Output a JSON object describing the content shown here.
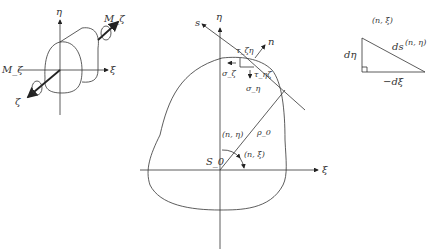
{
  "figure": {
    "left_panel": {
      "axis_eta": "η",
      "axis_xi": "ξ",
      "axis_zeta": "ζ",
      "moment_top": "M_ζ",
      "moment_left": "M_ζ"
    },
    "center_panel": {
      "axis_eta": "η",
      "axis_xi": "ξ",
      "tangent_s": "s",
      "normal_n": "n",
      "tau_zeta_eta": "τ_ζη",
      "sigma_zeta": "σ_ζ",
      "tau_eta_zeta": "τ_ηζ",
      "sigma_eta": "σ_η",
      "rho0": "ρ_0",
      "origin": "S_0",
      "angle_n_eta": "(n, η)",
      "angle_n_xi": "(n, ξ)"
    },
    "right_panel": {
      "angle_n_xi": "(n, ξ)",
      "angle_n_eta": "(n, η)",
      "ds": "ds",
      "d_eta": "dη",
      "minus_d_xi": "−dξ"
    }
  }
}
